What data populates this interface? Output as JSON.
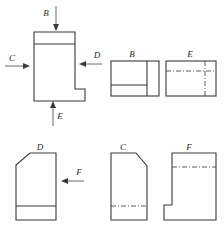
{
  "drawing": {
    "title": "Orthographic Projection Views",
    "type": "engineering-orthographic-projection",
    "background_color": "#ffffff",
    "line_color": "#3a3a3a",
    "hidden_line_color": "#4a4a4a",
    "label_color": "#2b2b2b"
  },
  "labels": {
    "b": "B",
    "c": "C",
    "d": "D",
    "e": "E",
    "f": "F",
    "view_b": "B",
    "view_e": "E",
    "view_d": "D",
    "view_c": "C",
    "view_f": "F"
  },
  "arrows": [
    {
      "name": "arrow-b",
      "label": "B",
      "direction": "down",
      "x": 50,
      "y": 12
    },
    {
      "name": "arrow-c",
      "label": "C",
      "direction": "right",
      "x": 6,
      "y": 62
    },
    {
      "name": "arrow-d",
      "label": "D",
      "direction": "left",
      "x": 80,
      "y": 60
    },
    {
      "name": "arrow-e",
      "label": "E",
      "direction": "up",
      "x": 50,
      "y": 105
    },
    {
      "name": "arrow-f",
      "label": "F",
      "direction": "left",
      "x": 66,
      "y": 178
    }
  ],
  "views": [
    {
      "name": "main-front-view",
      "label": "",
      "description": "Stepped L-shaped profile with raised top block and notched lower right"
    },
    {
      "name": "view-b",
      "label": "B",
      "description": "Rectangle with vertical division near right edge and horizontal division in lower portion"
    },
    {
      "name": "view-e",
      "label": "E",
      "description": "Rectangle with hidden horizontal line and hidden vertical line"
    },
    {
      "name": "view-d",
      "label": "D",
      "description": "Rectangle with chamfered top-left corner and solid horizontal line near bottom"
    },
    {
      "name": "view-c",
      "label": "C",
      "description": "Rectangle with chamfered top-right corner and hidden horizontal line near bottom"
    },
    {
      "name": "view-f",
      "label": "F",
      "description": "Rectangle with notch cut from bottom-left and hidden horizontal line near top"
    }
  ]
}
